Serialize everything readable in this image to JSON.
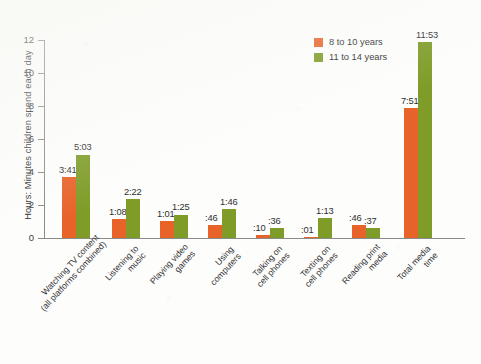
{
  "chart_data": {
    "type": "bar",
    "title": "",
    "subtitle": "",
    "xlabel": "",
    "ylabel": "Hours: Minutes children spend each day",
    "ylim": [
      0,
      12
    ],
    "yticks": [
      "0",
      "2",
      "4",
      "6",
      "8",
      "10",
      "12"
    ],
    "grid": false,
    "legend_position": "top-right",
    "categories": [
      "Watching TV content\n(all platforms combined)",
      "Listening to\nmusic",
      "Playing video\ngames",
      "Using\ncomputers",
      "Talking on\ncell phones",
      "Texting on\ncell phones",
      "Reading print\nmedia",
      "Total media\ntime"
    ],
    "series": [
      {
        "name": "8 to 10 years",
        "color": "#e8632a",
        "values": [
          3.683,
          1.133,
          1.017,
          0.767,
          0.167,
          0.017,
          0.767,
          7.85
        ],
        "labels": [
          "3:41",
          "1:08",
          "1:01",
          ":46",
          ":10",
          ":01",
          ":46",
          "7:51"
        ]
      },
      {
        "name": "11 to 14 years",
        "color": "#7f9c28",
        "values": [
          5.05,
          2.367,
          1.417,
          1.767,
          0.6,
          1.217,
          0.617,
          11.883
        ],
        "labels": [
          "5:03",
          "2:22",
          "1:25",
          "1:46",
          ":36",
          "1:13",
          ":37",
          "11:53"
        ]
      }
    ]
  },
  "legend": {
    "items": [
      {
        "label": "8 to 10 years",
        "color": "#e8632a"
      },
      {
        "label": "11 to 14 years",
        "color": "#7f9c28"
      }
    ]
  },
  "axis": {
    "y_title": "Hours: Minutes children spend each day",
    "y_ticks": [
      "12",
      "10",
      "8",
      "6",
      "4",
      "2",
      "0"
    ]
  }
}
